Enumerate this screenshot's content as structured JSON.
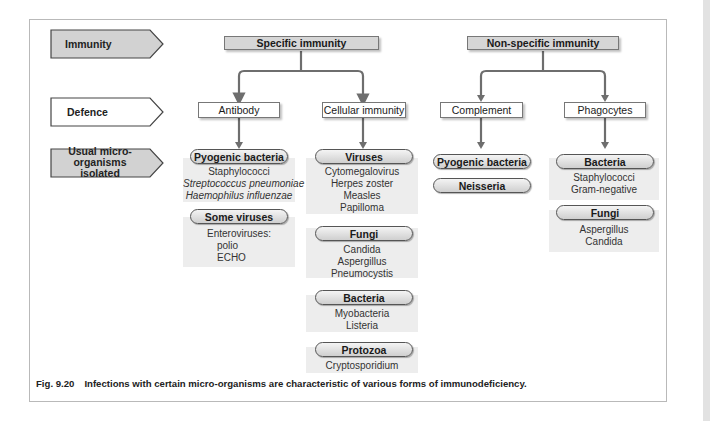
{
  "figure": {
    "row_labels": {
      "immunity": "Immunity",
      "defence": "Defence",
      "organisms_line1": "Usual micro-organisms",
      "organisms_line2": "isolated"
    },
    "branches": {
      "specific": {
        "title": "Specific immunity",
        "children": {
          "antibody": {
            "label": "Antibody",
            "groups": [
              {
                "title": "Pyogenic bacteria",
                "items": [
                  "Staphylococci",
                  "Streptococcus pneumoniae",
                  "Haemophilus influenzae"
                ],
                "italic_items": [
                  false,
                  true,
                  true
                ]
              },
              {
                "title": "Some viruses",
                "items": [
                  "Enteroviruses:",
                  "polio",
                  "ECHO"
                ]
              }
            ]
          },
          "cellular": {
            "label": "Cellular immunity",
            "groups": [
              {
                "title": "Viruses",
                "items": [
                  "Cytomegalovirus",
                  "Herpes zoster",
                  "Measles",
                  "Papilloma"
                ]
              },
              {
                "title": "Fungi",
                "items": [
                  "Candida",
                  "Aspergillus",
                  "Pneumocystis"
                ]
              },
              {
                "title": "Bacteria",
                "items": [
                  "Myobacteria",
                  "Listeria"
                ]
              },
              {
                "title": "Protozoa",
                "items": [
                  "Cryptosporidium"
                ]
              }
            ]
          }
        }
      },
      "nonspecific": {
        "title": "Non-specific immunity",
        "children": {
          "complement": {
            "label": "Complement",
            "groups": [
              {
                "title": "Pyogenic bacteria",
                "items": []
              },
              {
                "title": "Neisseria",
                "items": []
              }
            ]
          },
          "phagocytes": {
            "label": "Phagocytes",
            "groups": [
              {
                "title": "Bacteria",
                "items": [
                  "Staphylococci",
                  "Gram-negative"
                ]
              },
              {
                "title": "Fungi",
                "items": [
                  "Aspergillus",
                  "Candida"
                ]
              }
            ]
          }
        }
      }
    },
    "caption": {
      "number": "Fig. 9.20",
      "text": "Infections with certain micro-organisms are characteristic of various forms of immunodeficiency."
    },
    "colors": {
      "header_fill": "#d6d6d6",
      "panel_fill": "#ededed",
      "connector": "#6e6e6e",
      "border": "#777777"
    }
  }
}
